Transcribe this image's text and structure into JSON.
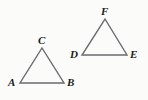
{
  "figure": {
    "background_color": "#fbfbfa",
    "stroke_color": "#6b6b70",
    "label_color": "#1c1c1c",
    "stroke_width": 1.4,
    "width": 148,
    "height": 100
  },
  "shapes": [
    {
      "id": "triangle-abc",
      "name": "triangle-abc",
      "type": "triangle",
      "points": "20,83 64,83 42,48",
      "vertices": [
        {
          "id": "A",
          "label": "A",
          "x": 20,
          "y": 83,
          "label_x": 8,
          "label_y": 77
        },
        {
          "id": "B",
          "label": "B",
          "x": 64,
          "y": 83,
          "label_x": 67,
          "label_y": 77
        },
        {
          "id": "C",
          "label": "C",
          "x": 42,
          "y": 48,
          "label_x": 38,
          "label_y": 35
        }
      ]
    },
    {
      "id": "triangle-def",
      "name": "triangle-def",
      "type": "triangle",
      "points": "82,55 127,55 105,19",
      "vertices": [
        {
          "id": "D",
          "label": "D",
          "x": 82,
          "y": 55,
          "label_x": 70,
          "label_y": 49
        },
        {
          "id": "E",
          "label": "E",
          "x": 127,
          "y": 55,
          "label_x": 130,
          "label_y": 49
        },
        {
          "id": "F",
          "label": "F",
          "x": 105,
          "y": 19,
          "label_x": 101,
          "label_y": 6
        }
      ]
    }
  ]
}
